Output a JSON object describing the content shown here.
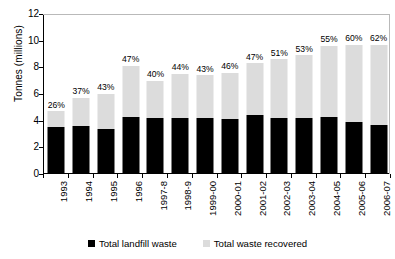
{
  "chart_data": {
    "type": "bar",
    "stacked": true,
    "title": "",
    "xlabel": "",
    "ylabel": "Tonnes (millions)",
    "ylim": [
      0,
      12
    ],
    "yticks": [
      0,
      2,
      4,
      6,
      8,
      10,
      12
    ],
    "grid": false,
    "legend_position": "bottom",
    "categories": [
      "1993",
      "1994",
      "1995",
      "1996",
      "1997-8",
      "1998-9",
      "1999-00",
      "2000-01",
      "2001-02",
      "2002-03",
      "2003-04",
      "2004-05",
      "2005-06",
      "2006-07"
    ],
    "series": [
      {
        "name": "Total landfill waste",
        "color": "#000000",
        "values": [
          3.5,
          3.6,
          3.4,
          4.3,
          4.2,
          4.2,
          4.2,
          4.1,
          4.4,
          4.2,
          4.2,
          4.3,
          3.9,
          3.7
        ]
      },
      {
        "name": "Total waste recovered",
        "color": "#dcdcdc",
        "values": [
          1.2,
          2.1,
          2.6,
          3.8,
          2.8,
          3.3,
          3.2,
          3.5,
          3.9,
          4.4,
          4.7,
          5.3,
          5.8,
          6.0
        ]
      }
    ],
    "totals": [
      4.7,
      5.7,
      6.0,
      8.1,
      7.0,
      7.5,
      7.4,
      7.6,
      8.3,
      8.6,
      8.9,
      9.6,
      9.7,
      9.7
    ],
    "annotations": {
      "label": "percent recovered",
      "values": [
        "26%",
        "37%",
        "43%",
        "47%",
        "40%",
        "44%",
        "43%",
        "46%",
        "47%",
        "51%",
        "53%",
        "55%",
        "60%",
        "62%"
      ]
    },
    "legend": [
      {
        "label": "Total landfill waste",
        "color": "#000000",
        "swatch": "black-square"
      },
      {
        "label": "Total waste recovered",
        "color": "#dcdcdc",
        "swatch": "gray-square"
      }
    ]
  }
}
